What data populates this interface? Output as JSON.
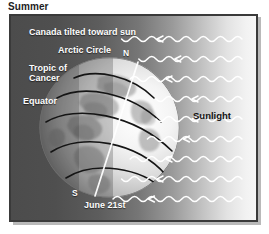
{
  "figure": {
    "title": "Summer",
    "date_label": "June 21st",
    "sunlight_label": "Sunlight",
    "pole_north": "N",
    "pole_south": "S",
    "annotations": [
      {
        "id": "canada",
        "text": "Canada tilted toward sun",
        "color": "#fdfdfd"
      },
      {
        "id": "arctic-circle",
        "text": "Arctic Circle",
        "color": "#fdfdfd"
      },
      {
        "id": "tropic-of-cancer-line1",
        "text": "Tropic of",
        "color": "#fdfdfd"
      },
      {
        "id": "tropic-of-cancer-line2",
        "text": "Cancer",
        "color": "#fdfdfd"
      },
      {
        "id": "equator",
        "text": "Equator",
        "color": "#fdfdfd"
      }
    ],
    "colors": {
      "title_text": "#1d1d1d",
      "label_light": "#fdfdfd",
      "label_dark": "#151515",
      "frame_border": "#3a3a3a",
      "background_dark": "#4c4c4c",
      "background_light": "#f6f6f6",
      "globe_light": "#f0f0f0",
      "globe_shadow": "#8d8d8d",
      "latitude_line": "#1a1a1a",
      "axis_line": "#ffffff",
      "ray_color": "#ffffff"
    },
    "latitude_lines_count": 5,
    "sun_rays_count": 9,
    "axis_tilt_note": "North pole tilted toward the sun (right side)"
  }
}
